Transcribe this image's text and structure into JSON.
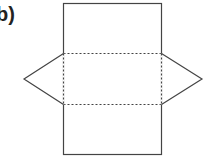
{
  "figure": {
    "label": "b)",
    "colors": {
      "stroke": "#444444",
      "background": "#ffffff"
    },
    "shapes": {
      "rectangle": {
        "x1": 63,
        "y1": 3,
        "x2": 162,
        "y2": 155
      },
      "fold_lines": [
        53,
        104
      ],
      "left_triangle_apex": {
        "x": 24,
        "y": 79
      },
      "right_triangle_apex": {
        "x": 202,
        "y": 79
      }
    }
  }
}
